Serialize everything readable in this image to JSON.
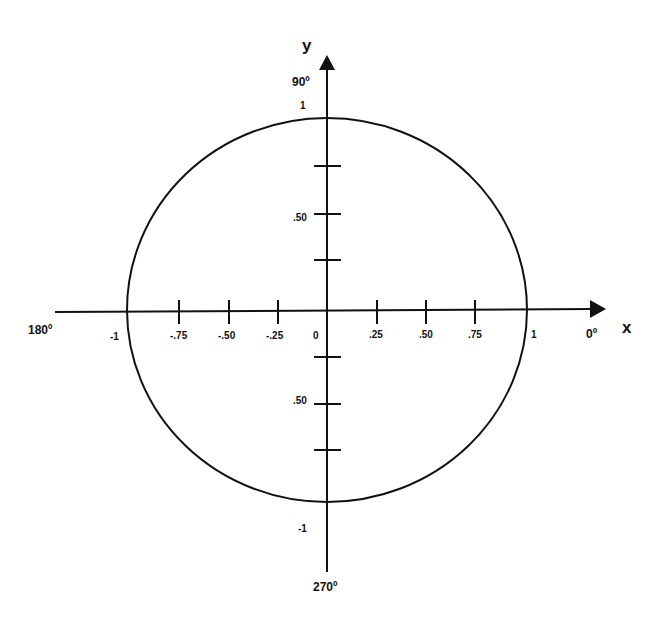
{
  "diagram": {
    "type": "unit-circle",
    "axes": {
      "x_label": "x",
      "y_label": "y"
    },
    "angle_labels": {
      "right": "0º",
      "top": "90º",
      "left": "180º",
      "bottom": "270º"
    },
    "x_ticks": [
      {
        "value": -1,
        "label": "-1"
      },
      {
        "value": -0.75,
        "label": "-.75"
      },
      {
        "value": -0.5,
        "label": "-.50"
      },
      {
        "value": -0.25,
        "label": "-.25"
      },
      {
        "value": 0,
        "label": "0"
      },
      {
        "value": 0.25,
        "label": ".25"
      },
      {
        "value": 0.5,
        "label": ".50"
      },
      {
        "value": 0.75,
        "label": ".75"
      },
      {
        "value": 1,
        "label": "1"
      }
    ],
    "y_ticks": [
      {
        "value": 1,
        "label": "1"
      },
      {
        "value": 0.75,
        "label": ""
      },
      {
        "value": 0.5,
        "label": ".50"
      },
      {
        "value": 0.25,
        "label": ""
      },
      {
        "value": -0.25,
        "label": ""
      },
      {
        "value": -0.5,
        "label": ".50"
      },
      {
        "value": -0.75,
        "label": ""
      },
      {
        "value": -1,
        "label": "-1"
      }
    ],
    "circle_radius": 1,
    "stroke_color": "#111111",
    "background_color": "#ffffff"
  }
}
